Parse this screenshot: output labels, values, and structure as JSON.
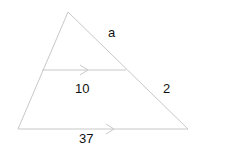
{
  "diagram": {
    "type": "triangle-with-parallel-segment",
    "colors": {
      "line": "#c8c8c8",
      "text": "#111111",
      "background": "#ffffff"
    },
    "labels": {
      "top_side": "a",
      "middle_segment": "10",
      "lower_side": "2",
      "base": "37"
    }
  }
}
